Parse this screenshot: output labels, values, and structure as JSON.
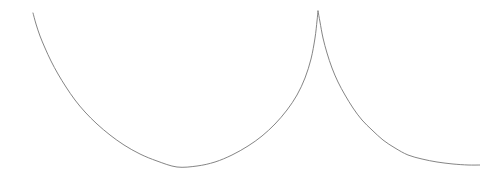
{
  "figure": {
    "background_color": "#ffffff",
    "width": 480,
    "height": 181
  },
  "chart_data": {
    "type": "line",
    "title": "",
    "subtitle": "",
    "xlabel": "",
    "ylabel": "",
    "grid": false,
    "legend": null,
    "axes_visible": false,
    "tick_labels": [],
    "annotations": [],
    "xlim": [
      0,
      480
    ],
    "ylim": [
      0,
      181
    ],
    "stroke_color": "#777777",
    "stroke_width": 0.9,
    "series": [
      {
        "name": "cycloid",
        "cusp_points": [
          {
            "x": 318,
            "y": 11
          }
        ],
        "minimum_points": [
          {
            "x": 177,
            "y": 167
          }
        ],
        "endpoints": [
          {
            "x": 33,
            "y": 13
          },
          {
            "x": 480,
            "y": 165
          }
        ],
        "points": [
          {
            "x": 33,
            "y": 13
          },
          {
            "x": 36,
            "y": 24
          },
          {
            "x": 40,
            "y": 36
          },
          {
            "x": 45,
            "y": 48
          },
          {
            "x": 51,
            "y": 61
          },
          {
            "x": 58,
            "y": 74
          },
          {
            "x": 66,
            "y": 87
          },
          {
            "x": 75,
            "y": 100
          },
          {
            "x": 85,
            "y": 112
          },
          {
            "x": 97,
            "y": 124
          },
          {
            "x": 110,
            "y": 135
          },
          {
            "x": 124,
            "y": 145
          },
          {
            "x": 140,
            "y": 154
          },
          {
            "x": 157,
            "y": 161
          },
          {
            "x": 177,
            "y": 167
          },
          {
            "x": 197,
            "y": 166
          },
          {
            "x": 215,
            "y": 162
          },
          {
            "x": 232,
            "y": 155
          },
          {
            "x": 248,
            "y": 146
          },
          {
            "x": 262,
            "y": 136
          },
          {
            "x": 275,
            "y": 124
          },
          {
            "x": 287,
            "y": 110
          },
          {
            "x": 297,
            "y": 95
          },
          {
            "x": 305,
            "y": 78
          },
          {
            "x": 311,
            "y": 59
          },
          {
            "x": 315,
            "y": 38
          },
          {
            "x": 317,
            "y": 21
          },
          {
            "x": 318,
            "y": 11
          },
          {
            "x": 320,
            "y": 22
          },
          {
            "x": 323,
            "y": 38
          },
          {
            "x": 327,
            "y": 53
          },
          {
            "x": 332,
            "y": 68
          },
          {
            "x": 338,
            "y": 82
          },
          {
            "x": 345,
            "y": 95
          },
          {
            "x": 353,
            "y": 108
          },
          {
            "x": 362,
            "y": 120
          },
          {
            "x": 372,
            "y": 130
          },
          {
            "x": 383,
            "y": 140
          },
          {
            "x": 395,
            "y": 148
          },
          {
            "x": 408,
            "y": 155
          },
          {
            "x": 422,
            "y": 159
          },
          {
            "x": 437,
            "y": 162
          },
          {
            "x": 453,
            "y": 164
          },
          {
            "x": 468,
            "y": 165
          },
          {
            "x": 480,
            "y": 165
          }
        ]
      }
    ]
  }
}
